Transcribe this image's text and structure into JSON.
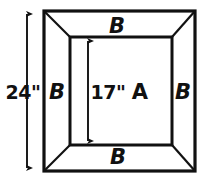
{
  "diagram": {
    "stroke_color": "#111111",
    "fill_color": "#ffffff",
    "labels": {
      "inner_region": "A",
      "border_top": "B",
      "border_right": "B",
      "border_bottom": "B",
      "border_left": "B",
      "outer_dimension": "24\"",
      "inner_dimension": "17\""
    },
    "dimensions": {
      "outer_height_label": "24\"",
      "outer_height_value": 24,
      "inner_height_label": "17\"",
      "inner_height_value": 17,
      "units": "inches"
    },
    "geometry": {
      "outer": {
        "left": 44,
        "top": 11,
        "right": 195,
        "bottom": 171
      },
      "inner": {
        "left": 70,
        "top": 37,
        "right": 172,
        "bottom": 145
      },
      "outer_dim_line_x": 27,
      "outer_dim_line_top": 14,
      "outer_dim_line_bottom": 168,
      "inner_dim_line_x": 88,
      "inner_dim_line_top": 40,
      "inner_dim_line_bottom": 141
    },
    "label_positions": {
      "outer_dimension": {
        "x": 23,
        "y": 92
      },
      "inner_dimension": {
        "x": 108,
        "y": 92
      },
      "inner_region": {
        "x": 140,
        "y": 92
      },
      "border_top": {
        "x": 117,
        "y": 26
      },
      "border_right": {
        "x": 183,
        "y": 92
      },
      "border_bottom": {
        "x": 118,
        "y": 157
      },
      "border_left": {
        "x": 57,
        "y": 92
      }
    }
  }
}
